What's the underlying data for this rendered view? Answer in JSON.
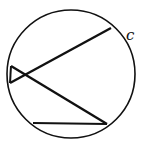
{
  "diagram": {
    "type": "circle-with-chords",
    "stroke_color": "#111111",
    "background": "#ffffff",
    "circle": {
      "cx": 71,
      "cy": 74,
      "r": 64,
      "label": "c"
    },
    "points": {
      "top_right": [
        111,
        28
      ],
      "left_upper": [
        11,
        66
      ],
      "left_lower": [
        10,
        83
      ],
      "bottom_right": [
        107,
        124
      ],
      "bottom_left": [
        33,
        123
      ]
    },
    "segments": [
      {
        "from": "left_lower",
        "to": "top_right"
      },
      {
        "from": "left_upper",
        "to": "bottom_right"
      },
      {
        "from": "bottom_left",
        "to": "bottom_right"
      },
      {
        "from": "left_upper",
        "to": "left_lower"
      }
    ]
  }
}
